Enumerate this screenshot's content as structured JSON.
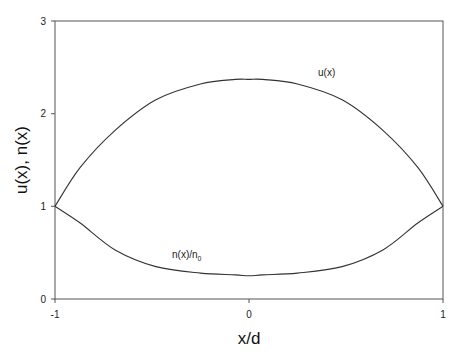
{
  "chart_data": {
    "type": "line",
    "title": "",
    "xlabel": "x/d",
    "ylabel": "u(x), n(x)",
    "xlim": [
      -1,
      1
    ],
    "ylim": [
      0,
      3
    ],
    "xticks": [
      "-1",
      "0",
      "1"
    ],
    "yticks": [
      "0",
      "1",
      "2",
      "3"
    ],
    "grid": false,
    "legend": "none",
    "annotations": [
      {
        "text": "u(x)",
        "x": 0.41,
        "y": 2.45
      },
      {
        "text": "n(x)/n",
        "subscript": "0",
        "x": -0.4,
        "y": 0.47
      }
    ],
    "series": [
      {
        "name": "u(x)",
        "x": [
          -1.0,
          -0.87,
          -0.69,
          -0.48,
          -0.25,
          -0.07,
          0.0,
          0.07,
          0.25,
          0.48,
          0.69,
          0.87,
          1.0
        ],
        "y": [
          1.0,
          1.42,
          1.82,
          2.15,
          2.32,
          2.37,
          2.37,
          2.37,
          2.32,
          2.15,
          1.82,
          1.42,
          1.0
        ]
      },
      {
        "name": "n(x)/n0",
        "x": [
          -1.0,
          -0.87,
          -0.69,
          -0.48,
          -0.25,
          -0.07,
          0.0,
          0.07,
          0.25,
          0.48,
          0.69,
          0.87,
          1.0
        ],
        "y": [
          1.0,
          0.82,
          0.53,
          0.35,
          0.28,
          0.26,
          0.25,
          0.26,
          0.28,
          0.35,
          0.53,
          0.82,
          1.0
        ]
      }
    ]
  },
  "labels": {
    "xlabel": "x/d",
    "ylabel": "u(x), n(x)",
    "u_label": "u(x)",
    "n_label": "n(x)/n",
    "n_label_sub": "0",
    "xtick_0": "-1",
    "xtick_1": "0",
    "xtick_2": "1",
    "ytick_0": "0",
    "ytick_1": "1",
    "ytick_2": "2",
    "ytick_3": "3"
  }
}
